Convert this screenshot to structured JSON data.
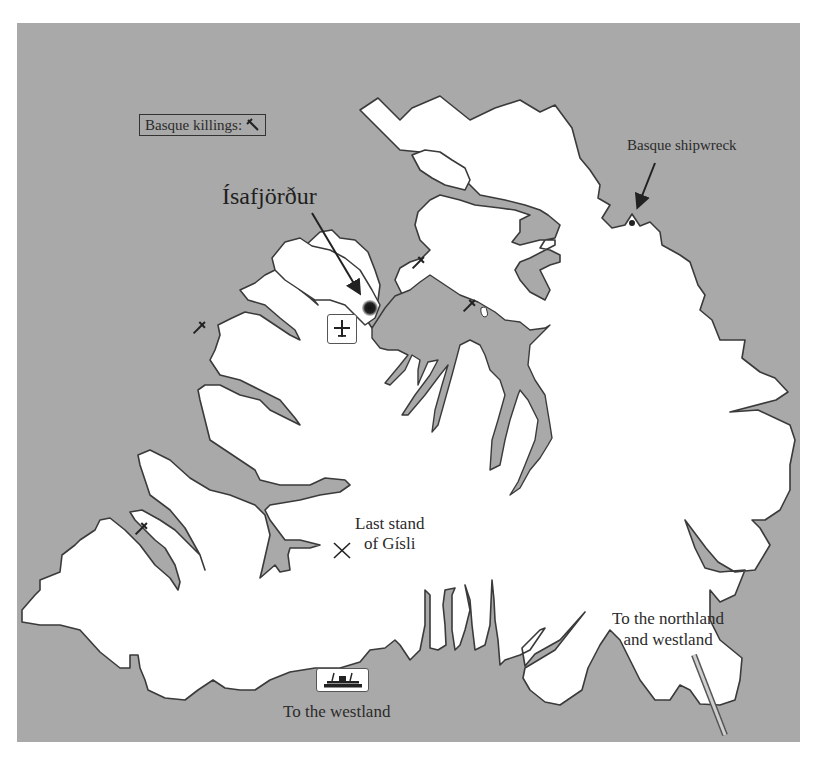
{
  "map": {
    "title": "Westfjords of Iceland",
    "colors": {
      "sea": "#a9a9a9",
      "land": "#ffffff",
      "coastline": "#3a3a3a",
      "text": "#2b2b2b"
    }
  },
  "legend": {
    "label": "Basque killings:",
    "icon": "dagger-icon"
  },
  "places": {
    "town": {
      "name": "Ísafjörður",
      "marker": "town-dot"
    },
    "shipwreck": {
      "label": "Basque shipwreck",
      "marker": "dot"
    },
    "gisli": {
      "line1": "Last stand",
      "line2": "of Gísli",
      "marker": "crossed-swords-icon"
    },
    "airport": {
      "icon": "airplane-icon"
    },
    "ferry": {
      "icon": "ferry-icon",
      "label": "To the westland"
    },
    "road": {
      "line1": "To the northland",
      "line2": "and westland",
      "icon": "road"
    }
  },
  "killing_sites": [
    {
      "x": 419,
      "y": 262
    },
    {
      "x": 470,
      "y": 305
    },
    {
      "x": 200,
      "y": 327
    },
    {
      "x": 142,
      "y": 528
    }
  ]
}
